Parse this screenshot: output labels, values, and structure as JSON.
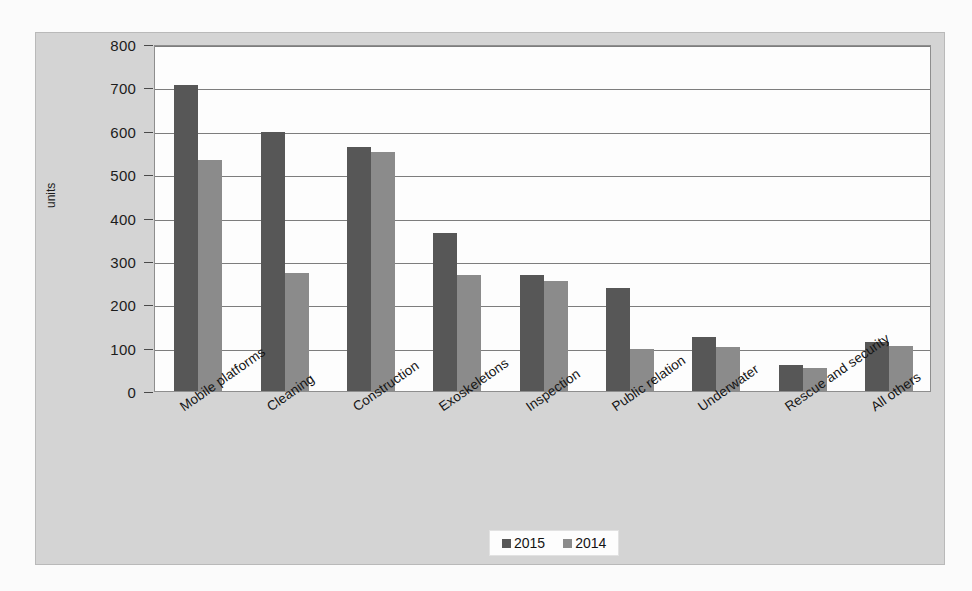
{
  "chart_data": {
    "type": "bar",
    "title": "",
    "xlabel": "",
    "ylabel": "units",
    "ylim": [
      0,
      800
    ],
    "yticks": [
      0,
      100,
      200,
      300,
      400,
      500,
      600,
      700,
      800
    ],
    "grid": true,
    "legend_position": "bottom",
    "categories": [
      "Mobile platforms",
      "Cleaning",
      "Construction",
      "Exoskeletons",
      "Inspection",
      "Public relation",
      "Underwater",
      "Rescue and security",
      "All others"
    ],
    "series": [
      {
        "name": "2015",
        "color": "#575757",
        "values": [
          705,
          598,
          562,
          365,
          268,
          238,
          124,
          60,
          112
        ]
      },
      {
        "name": "2014",
        "color": "#8b8b8b",
        "values": [
          533,
          273,
          551,
          267,
          253,
          97,
          102,
          52,
          103
        ]
      }
    ]
  },
  "legend": {
    "entries": [
      {
        "label": "2015"
      },
      {
        "label": "2014"
      }
    ]
  },
  "colors": {
    "series_2015": "#575757",
    "series_2014": "#8b8b8b",
    "panel_background": "#d4d4d4",
    "plot_background": "#fdfdfd",
    "gridline": "#7d7d7d",
    "page_background": "#fbfbfb"
  }
}
